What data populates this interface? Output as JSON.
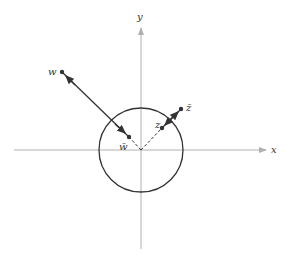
{
  "diagram": {
    "title": "",
    "axes": {
      "x_label": "x",
      "y_label": "y",
      "origin": [
        141,
        150
      ],
      "x_range_px": [
        14,
        268
      ],
      "y_range_px": [
        27,
        249
      ],
      "color": "#b0b0b0"
    },
    "circle": {
      "cx": 141,
      "cy": 150,
      "r": 42,
      "color": "#333333",
      "label": "unit circle"
    },
    "points": [
      {
        "id": "w",
        "label": "w",
        "x": 62,
        "y": 72
      },
      {
        "id": "w_bar",
        "label": "w̄",
        "x": 129,
        "y": 137
      },
      {
        "id": "z",
        "label": "z",
        "x": 162,
        "y": 128
      },
      {
        "id": "z_bar",
        "label": "z̄",
        "x": 181,
        "y": 109
      }
    ],
    "arrows": [
      {
        "from": "w_bar",
        "to": "w",
        "style": "solid",
        "description": "arrow from w̄ outward to w"
      },
      {
        "from": "z",
        "to": "z_bar",
        "style": "solid",
        "description": "arrow from z outward to z̄"
      }
    ],
    "dashed_segments": [
      {
        "from": "origin",
        "to": "w_bar"
      },
      {
        "from": "origin",
        "to": "z"
      }
    ],
    "colors": {
      "ink": "#333333",
      "axis": "#b0b0b0"
    }
  }
}
